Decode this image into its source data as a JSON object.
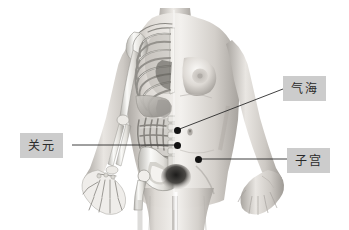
{
  "figure": {
    "width": 349,
    "height": 230,
    "background_color": "#ffffff",
    "title": ""
  },
  "artwork": {
    "colors": {
      "skin_light": "#f0eeeb",
      "skin_mid": "#cfcbc6",
      "skin_shadow": "#9d9994",
      "bone_light": "#fbfbf9",
      "bone_mid": "#d6d4cf",
      "bone_shadow": "#8f8d88",
      "organ_mid": "#b8b5b0",
      "organ_shadow": "#7d7a75",
      "dark_accent": "#3a3836"
    }
  },
  "labels": [
    {
      "id": "qihai",
      "text": "气海",
      "box": {
        "x": 283,
        "y": 76,
        "width": 43,
        "height": 25
      },
      "box_color": "#cccccc",
      "text_color": "#2a2a2a"
    },
    {
      "id": "guanyuan",
      "text": "关元",
      "box": {
        "x": 20,
        "y": 133,
        "width": 43,
        "height": 25
      },
      "box_color": "#cccccc",
      "text_color": "#2a2a2a"
    },
    {
      "id": "zigong",
      "text": "子宫",
      "box": {
        "x": 287,
        "y": 148,
        "width": 43,
        "height": 25
      },
      "box_color": "#cccccc",
      "text_color": "#2a2a2a"
    }
  ],
  "points": [
    {
      "id": "qihai",
      "label": "气海",
      "x": 177,
      "y": 130
    },
    {
      "id": "guanyuan",
      "label": "关元",
      "x": 177,
      "y": 145
    },
    {
      "id": "zigong",
      "label": "子宫",
      "x": 198,
      "y": 159
    }
  ],
  "leader_lines": [
    {
      "id": "qihai-leader",
      "x1": 177,
      "y1": 130,
      "x2": 283,
      "y2": 89,
      "color": "#2b2b2b",
      "width": 0.9
    },
    {
      "id": "guanyuan-leader",
      "x1": 72,
      "y1": 145,
      "x2": 177,
      "y2": 145,
      "color": "#2b2b2b",
      "width": 0.9
    },
    {
      "id": "zigong-leader",
      "x1": 198,
      "y1": 159,
      "x2": 287,
      "y2": 159,
      "color": "#2b2b2b",
      "width": 0.9
    }
  ]
}
